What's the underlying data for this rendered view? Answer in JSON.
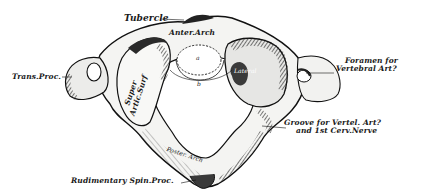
{
  "figure": {
    "colors": {
      "ink": "#111111",
      "bone_fill": "#f4f4f2",
      "shade": "#3a3a3a",
      "background": "#ffffff"
    }
  },
  "labels": {
    "tubercle": "Tubercle",
    "anter_arch": "Anter.Arch",
    "trans_proc": "Trans.Proc.",
    "super_artic_surf_line1": "Super",
    "super_artic_surf_line2": "Artic.Surf",
    "lateral_mass": "Lateral",
    "foramen_line1": "Foramen for",
    "foramen_line2": "Vertebral Art?",
    "groove_line1": "Groove for Vertel. Art?",
    "groove_line2": "and 1st Cerv.Nerve",
    "poster_arch": "Poster. Arch",
    "rudimentary_spin_proc": "Rudimentary Spin.Proc.",
    "letter_a": "a",
    "letter_b": "b"
  }
}
